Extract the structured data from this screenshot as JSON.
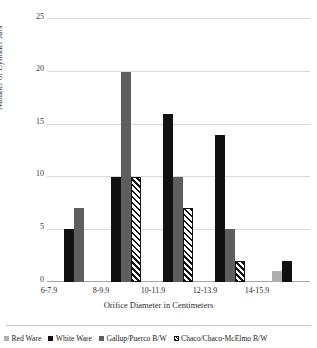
{
  "chart_data": {
    "type": "bar",
    "title": "",
    "xlabel": "Orifice Diameter in Centimeters",
    "ylabel": "Number of Cylinder Jars",
    "categories": [
      "6-7.9",
      "8-9.9",
      "10-11.9",
      "12-13.9",
      "14-15.9"
    ],
    "yticks": [
      "0",
      "5",
      "10",
      "15",
      "20",
      "25"
    ],
    "ylim": [
      0,
      25
    ],
    "grid": true,
    "legend_position": "bottom",
    "series": [
      {
        "name": "Red Ware",
        "color": "#aeaeae",
        "pattern": "solid",
        "values": [
          0,
          0,
          0,
          0,
          1
        ]
      },
      {
        "name": "White Ware",
        "color": "#111111",
        "pattern": "solid",
        "values": [
          5,
          10,
          16,
          14,
          2
        ]
      },
      {
        "name": "Gallup/Puerco B/W",
        "color": "#5e5e5e",
        "pattern": "solid",
        "values": [
          7,
          20,
          10,
          5,
          0
        ]
      },
      {
        "name": "Chaco/Chaco-McElmo B/W",
        "color": "#111111",
        "pattern": "hatch",
        "values": [
          0,
          10,
          7,
          2,
          0
        ]
      }
    ]
  },
  "axis": {
    "ylabel": "Number of Cylinder Jars",
    "xlabel": "Orifice Diameter in Centimeters",
    "ytick_0": "0",
    "ytick_1": "5",
    "ytick_2": "10",
    "ytick_3": "15",
    "ytick_4": "20",
    "ytick_5": "25",
    "xtick_0": "6-7.9",
    "xtick_1": "8-9.9",
    "xtick_2": "10-11.9",
    "xtick_3": "12-13.9",
    "xtick_4": "14-15.9"
  },
  "legend": {
    "items": [
      {
        "label": "Red Ware"
      },
      {
        "label": "White Ware"
      },
      {
        "label": "Gallup/Puerco B/W"
      },
      {
        "label": "Chaco/Chaco-McElmo B/W"
      }
    ]
  }
}
